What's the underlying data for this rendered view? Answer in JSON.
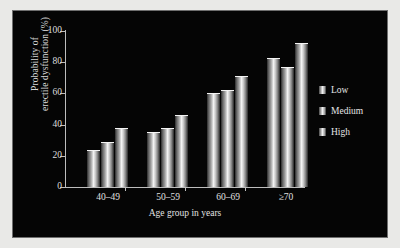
{
  "chart_data": {
    "type": "bar",
    "title": "",
    "xlabel": "Age group in years",
    "ylabel": "Probability of erectile dysfunction (%)",
    "ylabel_lines": [
      "Probability of",
      "erectile dysfunction (%)"
    ],
    "categories": [
      "40–49",
      "50–59",
      "60–69",
      "≥70"
    ],
    "series": [
      {
        "name": "Low",
        "values": [
          24,
          35,
          60,
          83
        ]
      },
      {
        "name": "Medium",
        "values": [
          29,
          38,
          62,
          77
        ]
      },
      {
        "name": "High",
        "values": [
          38,
          46,
          71,
          92
        ]
      }
    ],
    "ylim": [
      0,
      100
    ],
    "yticks": [
      0,
      20,
      40,
      60,
      80,
      100
    ],
    "ytick_labels": [
      "0",
      "20",
      "40",
      "60",
      "80",
      "100"
    ],
    "grid": false,
    "legend_position": "right",
    "legend": [
      "Low",
      "Medium",
      "High"
    ]
  },
  "colors": {
    "panel_background": "#050505",
    "figure_background": "#e9e9e7",
    "axis": "#bdbdbd",
    "text": "#e0e0e0",
    "bar_highlight": "#f2f2f2",
    "bar_shadow": "#242424"
  }
}
